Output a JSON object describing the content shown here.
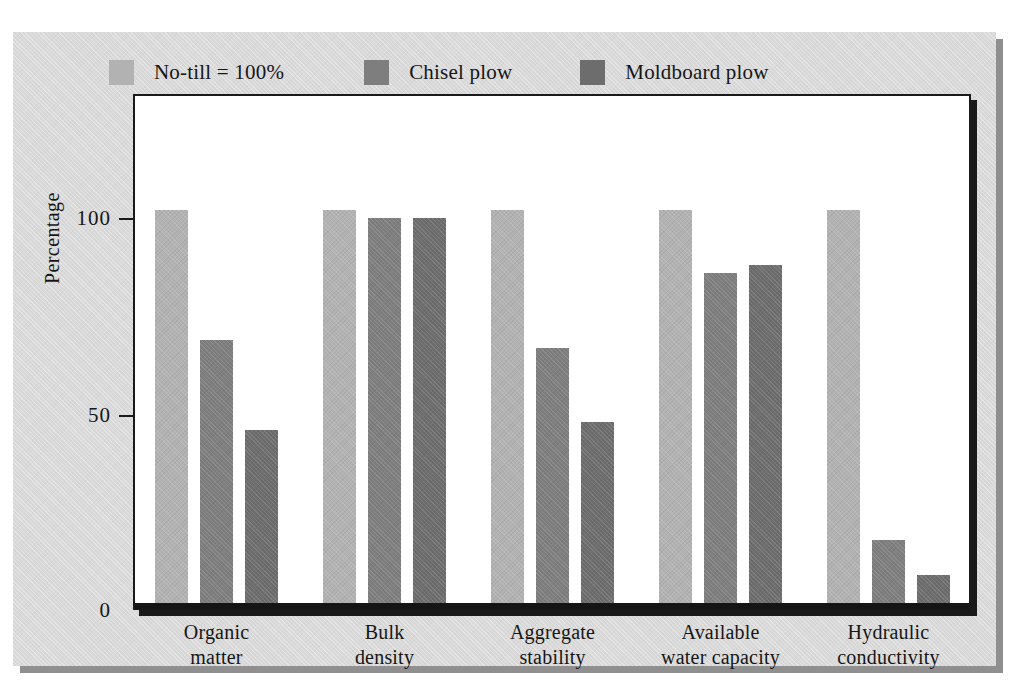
{
  "figure": {
    "kind": "bar-chart",
    "background_color": "#d9d9d9",
    "plot_background": "#ffffff"
  },
  "legend": {
    "position": "top-inside",
    "items": [
      {
        "label": "No-till  =  100%",
        "color": "#b2b2b2",
        "swatch_name": "legend-swatch-no-till"
      },
      {
        "label": "Chisel plow",
        "color": "#7e7e7e",
        "swatch_name": "legend-swatch-chisel-plow"
      },
      {
        "label": "Moldboard plow",
        "color": "#6d6d6d",
        "swatch_name": "legend-swatch-moldboard-plow"
      }
    ]
  },
  "axes": {
    "y_title": "Percentage",
    "y_ticks": [
      "100",
      "50",
      "0"
    ],
    "y_min": 0,
    "y_max": 105
  },
  "chart_data": {
    "type": "bar",
    "title": "",
    "xlabel": "",
    "ylabel": "Percentage",
    "ylim": [
      0,
      105
    ],
    "ytick_values": [
      0,
      50,
      100
    ],
    "grid": false,
    "legend_position": "top-inside",
    "categories": [
      "Organic\nmatter",
      "Bulk\ndensity",
      "Aggregate\nstability",
      "Available\nwater capacity",
      "Hydraulic\nconductivity"
    ],
    "categories_line1": [
      "Organic",
      "Bulk",
      "Aggregate",
      "Available",
      "Hydraulic"
    ],
    "categories_line2": [
      "matter",
      "density",
      "stability",
      "water capacity",
      "conductivity"
    ],
    "series": [
      {
        "name": "No-till = 100%",
        "color": "#b2b2b2",
        "values": [
          100,
          100,
          100,
          100,
          100
        ]
      },
      {
        "name": "Chisel plow",
        "color": "#7e7e7e",
        "values": [
          67,
          98,
          65,
          84,
          16
        ]
      },
      {
        "name": "Moldboard plow",
        "color": "#6d6d6d",
        "values": [
          44,
          98,
          46,
          86,
          7
        ]
      }
    ],
    "annotations": []
  }
}
